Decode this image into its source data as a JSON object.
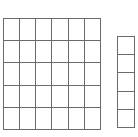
{
  "figure": {
    "background_color": "#ffffff",
    "width_px": 138,
    "height_px": 137
  },
  "style": {
    "line_color": "#6a6a6a",
    "line_width_px": 1.4,
    "cell_fill": "#ffffff"
  },
  "grids": [
    {
      "name": "large-grid",
      "columns": 6,
      "rows": 5,
      "x_px": 3,
      "y_px": 18,
      "width_px": 98,
      "height_px": 112,
      "cell_width_px": 16.3,
      "cell_height_px": 22.4,
      "total_cells": 30
    },
    {
      "name": "small-grid",
      "columns": 1,
      "rows": 5,
      "x_px": 117,
      "y_px": 36,
      "width_px": 18,
      "height_px": 92,
      "cell_width_px": 18,
      "cell_height_px": 18.4,
      "total_cells": 5
    }
  ]
}
